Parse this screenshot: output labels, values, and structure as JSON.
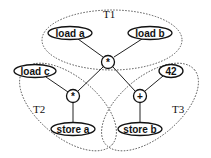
{
  "diagram": {
    "type": "dataflow-tree-partition",
    "groups": [
      {
        "id": "T1",
        "label": "T1"
      },
      {
        "id": "T2",
        "label": "T2"
      },
      {
        "id": "T3",
        "label": "T3"
      }
    ],
    "nodes": {
      "load_a": {
        "label": "load a",
        "group": "T1"
      },
      "load_b": {
        "label": "load b",
        "group": "T1"
      },
      "mul_top": {
        "label": "*",
        "group": "T1"
      },
      "load_c": {
        "label": "load c",
        "group": "T2"
      },
      "mul_left": {
        "label": "*",
        "group": "T2"
      },
      "store_a": {
        "label": "store a",
        "group": "T2"
      },
      "const_42": {
        "label": "42",
        "group": "T3"
      },
      "add": {
        "label": "+",
        "group": "T3"
      },
      "store_b": {
        "label": "store b",
        "group": "T3"
      }
    },
    "edges": [
      [
        "load_a",
        "mul_top"
      ],
      [
        "load_b",
        "mul_top"
      ],
      [
        "load_c",
        "mul_left"
      ],
      [
        "mul_top",
        "mul_left"
      ],
      [
        "mul_top",
        "add"
      ],
      [
        "const_42",
        "add"
      ],
      [
        "mul_left",
        "store_a"
      ],
      [
        "add",
        "store_b"
      ]
    ]
  }
}
